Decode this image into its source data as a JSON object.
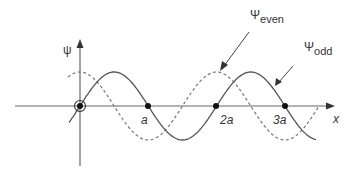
{
  "diagram": {
    "type": "wavefunction-plot",
    "axes": {
      "y_label": "ψ",
      "x_label": "x",
      "x_ticks": [
        "a",
        "2a",
        "3a"
      ]
    },
    "curves": [
      {
        "name": "Ψodd",
        "style": "solid",
        "function": "sin(πx/a)"
      },
      {
        "name": "Ψeven",
        "style": "dashed",
        "function": "cos(πx/a)"
      }
    ],
    "labels": {
      "even_main": "Ψ",
      "even_sub": "even",
      "odd_main": "Ψ",
      "odd_sub": "odd"
    },
    "colors": {
      "line": "#555555",
      "axis": "#666666",
      "dot": "#111111"
    }
  }
}
